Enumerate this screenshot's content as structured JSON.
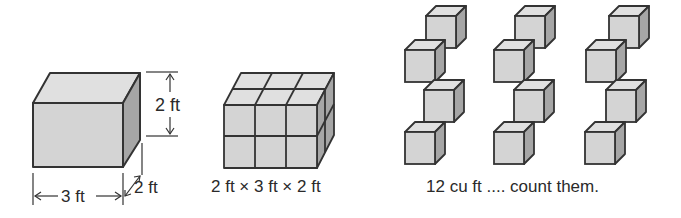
{
  "colors": {
    "front": "#d4d4d4",
    "top": "#e0e0e0",
    "side": "#a6a6a6",
    "edge": "#333333",
    "text": "#2a2a2a"
  },
  "figure1": {
    "height_label": "2 ft",
    "width_label": "3 ft",
    "depth_label": "2 ft"
  },
  "figure2": {
    "caption": "2 ft × 3 ft × 2 ft",
    "grid": {
      "cols": 3,
      "rows": 2,
      "depth": 2
    }
  },
  "figure3": {
    "caption": "12 cu ft .... count them.",
    "columns": 3,
    "cubes_per_column": 4,
    "total_cubes": 12
  }
}
